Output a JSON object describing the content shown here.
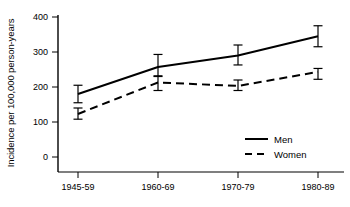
{
  "chart_data": {
    "type": "line",
    "title": "",
    "xlabel": "",
    "ylabel": "Incidence per 100,000 person-years",
    "categories": [
      "1945-59",
      "1960-69",
      "1970-79",
      "1980-89"
    ],
    "ylim": [
      0,
      400
    ],
    "yticks": [
      0,
      100,
      200,
      300,
      400
    ],
    "ytick_labels": [
      "0",
      "100",
      "200",
      "300",
      "400"
    ],
    "grid": false,
    "legend_position": "lower-right",
    "series": [
      {
        "name": "Men",
        "style": "solid",
        "color": "#000000",
        "values": [
          180,
          257,
          290,
          345
        ],
        "ci_low": [
          155,
          230,
          263,
          315
        ],
        "ci_high": [
          205,
          293,
          320,
          375
        ]
      },
      {
        "name": "Women",
        "style": "dashed",
        "color": "#000000",
        "values": [
          123,
          213,
          203,
          243
        ],
        "ci_low": [
          108,
          190,
          190,
          222
        ],
        "ci_high": [
          140,
          232,
          220,
          253
        ]
      }
    ]
  },
  "axis": {
    "y_title": "Incidence per 100,000 person-years",
    "tick_0": "0",
    "tick_100": "100",
    "tick_200": "200",
    "tick_300": "300",
    "tick_400": "400",
    "x_cat_0": "1945-59",
    "x_cat_1": "1960-69",
    "x_cat_2": "1970-79",
    "x_cat_3": "1980-89"
  },
  "legend": {
    "men_label": "Men",
    "women_label": "Women"
  }
}
